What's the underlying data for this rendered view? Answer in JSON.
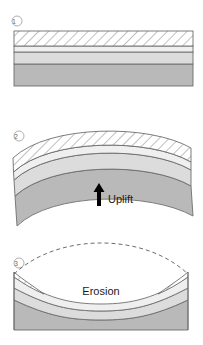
{
  "figure": {
    "title": "",
    "panels": [
      {
        "marker": "1",
        "caption": "",
        "description": "horizontal-layered-strata"
      },
      {
        "marker": "2",
        "caption": "Uplift",
        "description": "anticline-fold-uplifted-strata"
      },
      {
        "marker": "3",
        "caption": "Erosion",
        "description": "eroded-anticline-with-dashed-former-surface"
      }
    ]
  },
  "colors": {
    "hatch_fill": "#ffffff",
    "hatch_line": "#8c8c8c",
    "light_layer": "#eeeeee",
    "pale_layer": "#e3e3e3",
    "mid_layer": "#d8d8d8",
    "dark_layer": "#b8b8b8",
    "outline": "#6e6e6e",
    "marker_text": "#6b6b6b",
    "label_text": "#1a1a1a",
    "arrow": "#000000",
    "background": "#ffffff"
  },
  "icons": {
    "uplift_arrow": "arrow-up-icon",
    "erosion_surface": "dashed-line-icon"
  }
}
